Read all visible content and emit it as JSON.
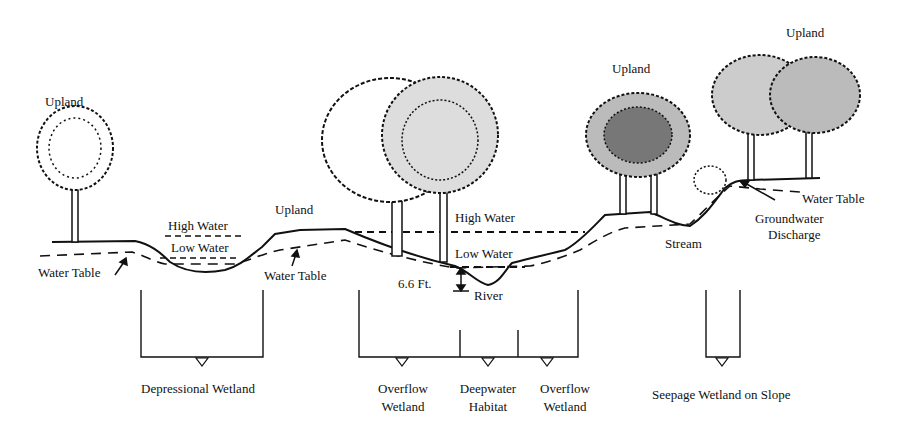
{
  "diagram": {
    "type": "cross-section",
    "labels": {
      "upland_left": "Upland",
      "upland_mid": "Upland",
      "upland_right1": "Upland",
      "upland_right2": "Upland",
      "high_water_left": "High Water",
      "low_water_left": "Low Water",
      "water_table_left": "Water Table",
      "water_table_mid": "Water Table",
      "high_water_river": "High Water",
      "low_water_river": "Low Water",
      "depth": "6.6 Ft.",
      "river": "River",
      "stream": "Stream",
      "water_table_right": "Water Table",
      "groundwater_discharge_line1": "Groundwater",
      "groundwater_discharge_line2": "Discharge"
    },
    "wetland_types": [
      {
        "line1": "Depressional Wetland",
        "line2": ""
      },
      {
        "line1": "Overflow",
        "line2": "Wetland"
      },
      {
        "line1": "Deepwater",
        "line2": "Habitat"
      },
      {
        "line1": "Overflow",
        "line2": "Wetland"
      },
      {
        "line1": "Seepage Wetland on Slope",
        "line2": ""
      }
    ],
    "colors": {
      "ink": "#111111",
      "background": "#ffffff"
    }
  }
}
